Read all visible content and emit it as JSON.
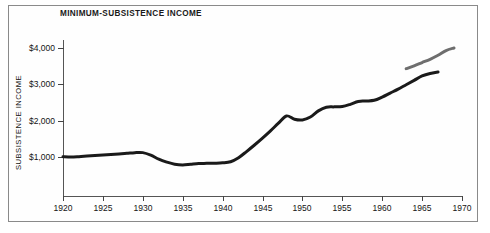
{
  "figure": {
    "title": "MINIMUM-SUBSISTENCE INCOME",
    "frame_color": "#8a8a8a",
    "background": "#ffffff"
  },
  "axes": {
    "y_title": "SUBSISTENCE INCOME",
    "y_ticks": [
      "$1,000",
      "$2,000",
      "$3,000",
      "$4,000"
    ],
    "x_ticks": [
      "1920",
      "1925",
      "1930",
      "1935",
      "1940",
      "1945",
      "1950",
      "1955",
      "1960",
      "1965",
      "1970"
    ]
  },
  "chart_data": {
    "type": "line",
    "title": "MINIMUM-SUBSISTENCE INCOME",
    "xlabel": "",
    "ylabel": "SUBSISTENCE INCOME",
    "xlim": [
      1920,
      1970
    ],
    "ylim": [
      0,
      4400
    ],
    "grid": false,
    "legend": "none",
    "x_tick_labels": [
      "1920",
      "1925",
      "1930",
      "1935",
      "1940",
      "1945",
      "1950",
      "1955",
      "1960",
      "1965",
      "1970"
    ],
    "y_tick_labels": [
      "$1,000",
      "$2,000",
      "$3,000",
      "$4,000"
    ],
    "y_tick_values": [
      1000,
      2000,
      3000,
      4000
    ],
    "series": [
      {
        "name": "minimum-subsistence income",
        "color": "#1a1a1a",
        "line_width": 3,
        "x": [
          1920,
          1921,
          1922,
          1923,
          1924,
          1925,
          1926,
          1927,
          1928,
          1929,
          1930,
          1931,
          1932,
          1933,
          1934,
          1935,
          1936,
          1937,
          1938,
          1939,
          1940,
          1941,
          1942,
          1943,
          1944,
          1945,
          1946,
          1947,
          1948,
          1949,
          1950,
          1951,
          1952,
          1953,
          1954,
          1955,
          1956,
          1957,
          1958,
          1959,
          1960,
          1961,
          1962,
          1963,
          1964,
          1965,
          1966,
          1967
        ],
        "y": [
          1010,
          1000,
          1010,
          1025,
          1040,
          1055,
          1070,
          1085,
          1100,
          1120,
          1120,
          1050,
          940,
          860,
          800,
          780,
          800,
          820,
          825,
          830,
          840,
          870,
          980,
          1150,
          1330,
          1520,
          1720,
          1930,
          2130,
          2040,
          2020,
          2100,
          2270,
          2370,
          2380,
          2390,
          2450,
          2530,
          2540,
          2560,
          2650,
          2760,
          2870,
          2990,
          3110,
          3230,
          3300,
          3340
        ]
      },
      {
        "name": "projected / upper band",
        "color": "#6e6e6e",
        "line_width": 3,
        "x": [
          1963,
          1964,
          1965,
          1966,
          1967,
          1968,
          1969
        ],
        "y": [
          3430,
          3510,
          3600,
          3690,
          3800,
          3930,
          4000
        ]
      }
    ]
  }
}
